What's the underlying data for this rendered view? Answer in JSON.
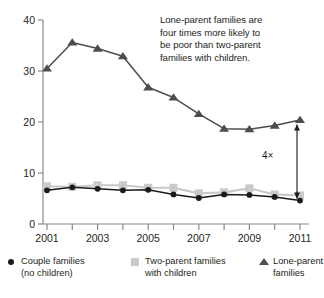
{
  "annotation": {
    "lines": [
      "Lone-parent families are",
      "four times more likely to",
      "be poor than two-parent",
      "families with children."
    ],
    "multiplier_label": "4×"
  },
  "legend": {
    "items": [
      {
        "marker": "circle-marker",
        "line1": "Couple families",
        "line2": "(no children)",
        "color": "#1a1a1a"
      },
      {
        "marker": "square-marker",
        "line1": "Two-parent families",
        "line2": "with children",
        "color": "#c9c9c9"
      },
      {
        "marker": "triangle-marker",
        "line1": "Lone-parent",
        "line2": "families",
        "color": "#4d4d4d"
      }
    ]
  },
  "axis": {
    "y_ticks": [
      "0",
      "10",
      "20",
      "30",
      "40"
    ],
    "x_ticks": [
      "2001",
      "",
      "2003",
      "",
      "2005",
      "",
      "2007",
      "",
      "2009",
      "",
      "2011"
    ]
  },
  "chart_data": {
    "type": "line",
    "title": "",
    "xlabel": "",
    "ylabel": "",
    "ylim": [
      0,
      40
    ],
    "xlim": [
      2001,
      2011
    ],
    "grid": false,
    "legend_position": "bottom",
    "x": [
      2001,
      2002,
      2003,
      2004,
      2005,
      2006,
      2007,
      2008,
      2009,
      2010,
      2011
    ],
    "categories": [
      "2001",
      "2002",
      "2003",
      "2004",
      "2005",
      "2006",
      "2007",
      "2008",
      "2009",
      "2010",
      "2011"
    ],
    "series": [
      {
        "name": "Couple families (no children)",
        "marker": "circle",
        "color": "#1a1a1a",
        "values": [
          6.6,
          7.2,
          6.9,
          6.6,
          6.7,
          5.8,
          5.1,
          5.8,
          5.7,
          5.3,
          4.6
        ]
      },
      {
        "name": "Two-parent families with children",
        "marker": "square",
        "color": "#c9c9c9",
        "values": [
          7.4,
          7.3,
          7.6,
          7.6,
          7.1,
          7.1,
          6.0,
          6.2,
          7.0,
          5.8,
          5.6
        ]
      },
      {
        "name": "Lone-parent families",
        "marker": "triangle",
        "color": "#4d4d4d",
        "values": [
          30.5,
          35.6,
          34.4,
          32.9,
          26.8,
          24.8,
          21.6,
          18.7,
          18.6,
          19.3,
          20.4
        ]
      }
    ],
    "annotations": [
      {
        "text": "Lone-parent families are four times more likely to be poor than two-parent families with children.",
        "type": "textbox"
      },
      {
        "text": "4×",
        "type": "arrow-label",
        "from": 19.5,
        "to": 5.0,
        "at_x": 2011
      }
    ]
  }
}
